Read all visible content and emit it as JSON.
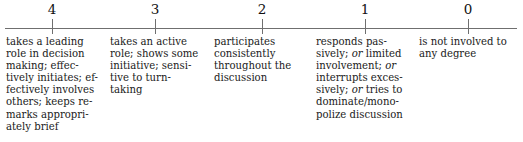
{
  "figure": {
    "type": "rating-scale",
    "orientation": "horizontal",
    "axis": {
      "line_color": "#6f6f6f",
      "start_x": 5,
      "end_x": 517
    },
    "ticks": [
      {
        "label": "4",
        "x": 52
      },
      {
        "label": "3",
        "x": 155
      },
      {
        "label": "2",
        "x": 262
      },
      {
        "label": "1",
        "x": 365
      },
      {
        "label": "0",
        "x": 468
      }
    ],
    "descriptors": [
      {
        "anchor": "4",
        "text": "takes a leading role in decision making; effectively initiates; effectively involves others; keeps remarks appropriately brief",
        "lines": [
          "takes a leading",
          "role in decision",
          "making; effec-",
          "tively initiates; ef-",
          "fectively involves",
          "others; keeps re-",
          "marks appropri-",
          "ately brief"
        ]
      },
      {
        "anchor": "3",
        "text": "takes an active role; shows some initiative; sensitive to turn-taking",
        "lines": [
          "takes an active",
          "role; shows some",
          "initiative; sensi-",
          "tive to turn-",
          "taking"
        ]
      },
      {
        "anchor": "2",
        "text": "participates consistently throughout the discussion",
        "lines": [
          "participates",
          "consistently",
          "throughout the",
          "discussion"
        ]
      },
      {
        "anchor": "1",
        "text": "responds passively; or limited involvement; or interrupts excessively; or tries to dominate/monopolize discussion",
        "lines": [
          "responds pas-",
          "sively; or limited",
          "involvement; or",
          "interrupts exces-",
          "sively; or tries to",
          "dominate/mono-",
          "polize discussion"
        ],
        "italic_words": [
          "or"
        ]
      },
      {
        "anchor": "0",
        "text": "is not involved to any degree",
        "lines": [
          "is not involved to",
          "any degree"
        ]
      }
    ]
  }
}
